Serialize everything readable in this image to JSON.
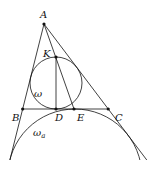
{
  "diagram": {
    "type": "geometry",
    "points": {
      "A": {
        "label": "A"
      },
      "B": {
        "label": "B"
      },
      "C": {
        "label": "C"
      },
      "D": {
        "label": "D"
      },
      "E": {
        "label": "E"
      },
      "K": {
        "label": "K"
      }
    },
    "circles": {
      "incircle": {
        "label": "ω"
      },
      "excircle": {
        "label": "ω",
        "subscript": "a"
      }
    },
    "segments": [
      "AB",
      "AC",
      "BC",
      "KD",
      "AE"
    ]
  }
}
